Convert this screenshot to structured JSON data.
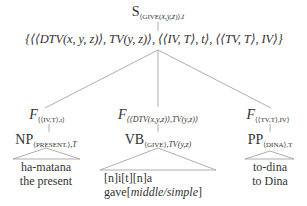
{
  "diagram": {
    "type": "syntax-tree",
    "root": {
      "label": "S",
      "subscript": "⟨GIVE(x,y,z)⟩,t",
      "subscript_parts": {
        "head": "⟨GIVE(",
        "vars": "x,y,z",
        "tail": ")⟩,",
        "type": "t"
      }
    },
    "type_set": {
      "text": "{⟨⟨DTV(x, y, z)⟩, TV(y, z)⟩, ⟨⟨IV, T⟩, t⟩, ⟨⟨TV, T⟩, IV⟩}"
    },
    "children": [
      {
        "functor": {
          "label": "F",
          "subscript": "⟨⟨IV,T⟩,t⟩"
        },
        "phrase": {
          "label": "NP",
          "subscript_word": "⟨PRESENT.⟩",
          "subscript_type": ",T"
        },
        "leaf": {
          "line1": "ha-matana",
          "line2": "the present"
        }
      },
      {
        "functor": {
          "label": "F",
          "subscript": "⟨⟨DTV(x,y,z)⟩,TV(y,z)⟩"
        },
        "phrase": {
          "label": "VB",
          "subscript_word": "⟨GIVE⟩",
          "subscript_type": ",TV(y,z)"
        },
        "leaf": {
          "line1": "[n]i[t][n]a",
          "line2_prefix": "gave[",
          "line2_italic": "middle/simple",
          "line2_suffix": "]"
        }
      },
      {
        "functor": {
          "label": "F",
          "subscript": "⟨⟨TV,T⟩,IV⟩"
        },
        "phrase": {
          "label": "PP",
          "subscript_word": "⟨DINA⟩",
          "subscript_type": ",T"
        },
        "leaf": {
          "line1": "to-dina",
          "line2": "to Dina"
        }
      }
    ],
    "colors": {
      "text": "#333333",
      "lines": "#9a9a9a"
    }
  }
}
